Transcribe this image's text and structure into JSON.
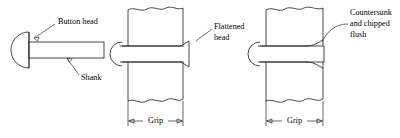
{
  "figure": {
    "labels": {
      "button_head": "Button head",
      "shank": "Shank",
      "flattened_head_line1": "Flattened",
      "flattened_head_line2": "head",
      "countersunk_line1": "Countersunk",
      "countersunk_line2": "and chipped",
      "countersunk_line3": "flush",
      "grip_middle": "Grip",
      "grip_right": "Grip"
    },
    "colors": {
      "stroke": "#1a1a1a",
      "leader": "#333333",
      "background": "#ffffff",
      "text": "#000000"
    }
  }
}
